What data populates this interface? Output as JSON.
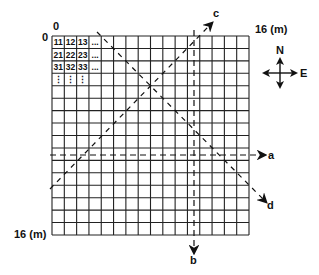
{
  "diagram": {
    "type": "sampling grid with transects",
    "grid": {
      "rows": 16,
      "cols": 16,
      "origin_label_top": "0",
      "origin_label_left": "0",
      "x_end_label": "16 (m)",
      "y_end_label": "16 (m)",
      "cell_labels": [
        [
          "11",
          "12",
          "13",
          "..."
        ],
        [
          "21",
          "22",
          "23",
          "..."
        ],
        [
          "31",
          "32",
          "33",
          "..."
        ],
        [
          "⋮",
          "⋮",
          "⋮",
          ""
        ]
      ]
    },
    "transects": [
      {
        "label": "a",
        "direction": "horizontal, west to east",
        "style": "dashed"
      },
      {
        "label": "b",
        "direction": "vertical, north to south",
        "style": "dashed"
      },
      {
        "label": "c",
        "direction": "diagonal, southwest to northeast",
        "style": "dashed"
      },
      {
        "label": "d",
        "direction": "diagonal, northwest to southeast",
        "style": "dashed"
      }
    ],
    "compass": {
      "north_label": "N",
      "east_label": "E",
      "icon": "compass-rose-icon"
    }
  }
}
